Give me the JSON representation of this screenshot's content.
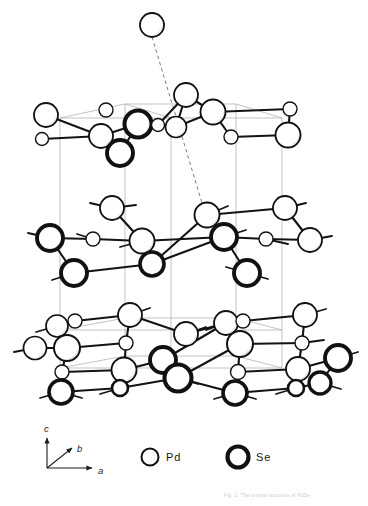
{
  "figure": {
    "title_visible": false,
    "background": "#ffffff",
    "width": 368,
    "height": 506
  },
  "colors": {
    "atom_outline": "#111111",
    "atom_fill": "#ffffff",
    "atom_shadow": "#9a9a9a",
    "bond": "#131313",
    "cell_edge": "#b4b4b4",
    "dashed_line": "#7d7d7d",
    "text": "#141414",
    "caption": "#c9c9c9"
  },
  "axes": {
    "name": "axis-triad",
    "origin": [
      47,
      468
    ],
    "labels": [
      {
        "text": "c",
        "x": 44,
        "y": 432
      },
      {
        "text": "b",
        "x": 77,
        "y": 452
      },
      {
        "text": "a",
        "x": 98,
        "y": 474
      }
    ],
    "arrows": [
      {
        "name": "c-axis-arrow",
        "x1": 47,
        "y1": 468,
        "x2": 47,
        "y2": 438
      },
      {
        "name": "b-axis-arrow",
        "x1": 47,
        "y1": 468,
        "x2": 72,
        "y2": 448
      },
      {
        "name": "a-axis-arrow",
        "x1": 47,
        "y1": 468,
        "x2": 92,
        "y2": 468
      }
    ]
  },
  "legend": {
    "name": "atom-legend",
    "entries": [
      {
        "label": "Pd",
        "symbol": "thin-circle",
        "cx": 150,
        "cy": 457,
        "r": 8.5,
        "stroke_width": 2.0,
        "label_x": 166,
        "label_y": 461
      },
      {
        "label": "Se",
        "symbol": "thick-circle",
        "cx": 238,
        "cy": 457,
        "r": 10.5,
        "stroke_width": 4.2,
        "label_x": 256,
        "label_y": 461
      }
    ]
  },
  "caption": {
    "name": "faint-footer-caption",
    "text": "Fig. 1.  The crystal structure of PdSe",
    "x": 224,
    "y": 497
  },
  "chart_data": {
    "type": "scatter",
    "title": "",
    "xlabel": "",
    "ylabel": "",
    "species": [
      {
        "name": "Pd",
        "style": "thin-circle",
        "stroke_width": 1.7
      },
      {
        "name": "Se",
        "style": "thick-circle",
        "stroke_width": 3.4
      }
    ],
    "cell_edges": [
      [
        60,
        118,
        125,
        104
      ],
      [
        125,
        104,
        236,
        104
      ],
      [
        236,
        104,
        282,
        118
      ],
      [
        282,
        118,
        171,
        118
      ],
      [
        171,
        118,
        60,
        118
      ],
      [
        125,
        104,
        171,
        118
      ],
      [
        60,
        118,
        60,
        368
      ],
      [
        125,
        104,
        125,
        356
      ],
      [
        236,
        104,
        236,
        356
      ],
      [
        282,
        118,
        282,
        368
      ],
      [
        171,
        118,
        171,
        368
      ],
      [
        60,
        368,
        125,
        356
      ],
      [
        125,
        356,
        236,
        356
      ],
      [
        236,
        356,
        282,
        368
      ],
      [
        282,
        368,
        171,
        368
      ],
      [
        171,
        368,
        60,
        368
      ],
      [
        60,
        330,
        125,
        318
      ],
      [
        125,
        318,
        236,
        318
      ],
      [
        236,
        318,
        282,
        330
      ],
      [
        282,
        330,
        171,
        330
      ],
      [
        171,
        330,
        60,
        330
      ]
    ],
    "dashed_lines": [
      [
        152,
        37,
        205,
        213
      ]
    ],
    "layers": [
      {
        "name": "isolated-top-atom",
        "atoms": [
          {
            "el": "Pd",
            "x": 152,
            "y": 25,
            "r": 12
          }
        ],
        "bonds": []
      },
      {
        "name": "upper-layer",
        "atoms": [
          {
            "el": "Pd",
            "x": 46,
            "y": 115,
            "r": 12
          },
          {
            "el": "Pd",
            "x": 42,
            "y": 139,
            "r": 6.5
          },
          {
            "el": "Pd",
            "x": 106,
            "y": 110,
            "r": 7
          },
          {
            "el": "Pd",
            "x": 101,
            "y": 136,
            "r": 12
          },
          {
            "el": "Se",
            "x": 120,
            "y": 153,
            "r": 13
          },
          {
            "el": "Se",
            "x": 138,
            "y": 124,
            "r": 13.5
          },
          {
            "el": "Pd",
            "x": 158,
            "y": 125,
            "r": 6.5
          },
          {
            "el": "Pd",
            "x": 176,
            "y": 127,
            "r": 10.5
          },
          {
            "el": "Pd",
            "x": 186,
            "y": 95,
            "r": 12
          },
          {
            "el": "Pd",
            "x": 213,
            "y": 112,
            "r": 12.5
          },
          {
            "el": "Pd",
            "x": 231,
            "y": 137,
            "r": 7
          },
          {
            "el": "Pd",
            "x": 290,
            "y": 109,
            "r": 7
          },
          {
            "el": "Pd",
            "x": 288,
            "y": 135,
            "r": 12.5
          }
        ],
        "bonds": [
          [
            46,
            115,
            101,
            136
          ],
          [
            101,
            136,
            138,
            124
          ],
          [
            138,
            124,
            158,
            125
          ],
          [
            158,
            125,
            176,
            127
          ],
          [
            176,
            127,
            213,
            112
          ],
          [
            186,
            95,
            213,
            112
          ],
          [
            213,
            112,
            231,
            137
          ],
          [
            231,
            137,
            288,
            135
          ],
          [
            120,
            153,
            138,
            124
          ],
          [
            101,
            136,
            120,
            153
          ],
          [
            42,
            139,
            101,
            136
          ],
          [
            186,
            95,
            176,
            127
          ],
          [
            186,
            95,
            158,
            125
          ],
          [
            290,
            109,
            288,
            135
          ],
          [
            213,
            112,
            290,
            109
          ]
        ]
      },
      {
        "name": "middle-layer",
        "atoms": [
          {
            "el": "Se",
            "x": 50,
            "y": 238,
            "r": 13
          },
          {
            "el": "Se",
            "x": 74,
            "y": 273,
            "r": 13
          },
          {
            "el": "Pd",
            "x": 93,
            "y": 239,
            "r": 7
          },
          {
            "el": "Pd",
            "x": 112,
            "y": 208,
            "r": 12
          },
          {
            "el": "Pd",
            "x": 142,
            "y": 241,
            "r": 12.5
          },
          {
            "el": "Pd",
            "x": 151,
            "y": 259,
            "r": 8
          },
          {
            "el": "Se",
            "x": 152,
            "y": 264,
            "r": 12
          },
          {
            "el": "Pd",
            "x": 207,
            "y": 215,
            "r": 12.5
          },
          {
            "el": "Se",
            "x": 224,
            "y": 237,
            "r": 13
          },
          {
            "el": "Pd",
            "x": 266,
            "y": 239,
            "r": 7
          },
          {
            "el": "Se",
            "x": 247,
            "y": 273,
            "r": 13
          },
          {
            "el": "Pd",
            "x": 285,
            "y": 208,
            "r": 12
          },
          {
            "el": "Pd",
            "x": 310,
            "y": 240,
            "r": 12
          }
        ],
        "bonds": [
          [
            50,
            238,
            93,
            239
          ],
          [
            93,
            239,
            142,
            241
          ],
          [
            50,
            238,
            74,
            273
          ],
          [
            112,
            208,
            142,
            241
          ],
          [
            142,
            241,
            152,
            264
          ],
          [
            152,
            264,
            207,
            215
          ],
          [
            207,
            215,
            224,
            237
          ],
          [
            224,
            237,
            266,
            239
          ],
          [
            266,
            239,
            310,
            240
          ],
          [
            224,
            237,
            247,
            273
          ],
          [
            285,
            208,
            310,
            240
          ],
          [
            74,
            273,
            152,
            264
          ],
          [
            142,
            241,
            224,
            237
          ],
          [
            152,
            264,
            224,
            237
          ],
          [
            207,
            215,
            285,
            208
          ]
        ],
        "stubs": [
          [
            50,
            238,
            28,
            233
          ],
          [
            74,
            273,
            52,
            280
          ],
          [
            112,
            208,
            90,
            203
          ],
          [
            112,
            208,
            136,
            205
          ],
          [
            93,
            239,
            77,
            234
          ],
          [
            207,
            215,
            228,
            206
          ],
          [
            266,
            239,
            288,
            244
          ],
          [
            247,
            273,
            226,
            267
          ],
          [
            247,
            273,
            268,
            279
          ],
          [
            285,
            208,
            306,
            203
          ],
          [
            310,
            240,
            332,
            236
          ],
          [
            224,
            237,
            246,
            230
          ],
          [
            142,
            241,
            120,
            247
          ]
        ]
      },
      {
        "name": "lower-layer",
        "atoms": [
          {
            "el": "Pd",
            "x": 57,
            "y": 326,
            "r": 11
          },
          {
            "el": "Pd",
            "x": 75,
            "y": 321,
            "r": 7
          },
          {
            "el": "Pd",
            "x": 35,
            "y": 348,
            "r": 11.5
          },
          {
            "el": "Pd",
            "x": 67,
            "y": 348,
            "r": 13
          },
          {
            "el": "Pd",
            "x": 62,
            "y": 372,
            "r": 7
          },
          {
            "el": "Se",
            "x": 61,
            "y": 392,
            "r": 12
          },
          {
            "el": "Pd",
            "x": 130,
            "y": 315,
            "r": 12
          },
          {
            "el": "Pd",
            "x": 126,
            "y": 343,
            "r": 7
          },
          {
            "el": "Pd",
            "x": 124,
            "y": 370,
            "r": 12.5
          },
          {
            "el": "Se",
            "x": 120,
            "y": 388,
            "r": 8
          },
          {
            "el": "Pd",
            "x": 186,
            "y": 334,
            "r": 12
          },
          {
            "el": "Se",
            "x": 163,
            "y": 360,
            "r": 13
          },
          {
            "el": "Se",
            "x": 178,
            "y": 378,
            "r": 13.5
          },
          {
            "el": "Pd",
            "x": 226,
            "y": 323,
            "r": 12
          },
          {
            "el": "Pd",
            "x": 243,
            "y": 321,
            "r": 7
          },
          {
            "el": "Pd",
            "x": 240,
            "y": 344,
            "r": 13
          },
          {
            "el": "Pd",
            "x": 238,
            "y": 372,
            "r": 7.5
          },
          {
            "el": "Se",
            "x": 235,
            "y": 393,
            "r": 12
          },
          {
            "el": "Pd",
            "x": 305,
            "y": 315,
            "r": 12
          },
          {
            "el": "Pd",
            "x": 302,
            "y": 343,
            "r": 7
          },
          {
            "el": "Pd",
            "x": 298,
            "y": 369,
            "r": 12
          },
          {
            "el": "Se",
            "x": 296,
            "y": 388,
            "r": 8
          },
          {
            "el": "Se",
            "x": 338,
            "y": 358,
            "r": 13
          },
          {
            "el": "Se",
            "x": 320,
            "y": 383,
            "r": 11
          }
        ],
        "bonds": [
          [
            57,
            326,
            75,
            321
          ],
          [
            57,
            326,
            67,
            348
          ],
          [
            35,
            348,
            67,
            348
          ],
          [
            67,
            348,
            62,
            372
          ],
          [
            62,
            372,
            61,
            392
          ],
          [
            75,
            321,
            130,
            315
          ],
          [
            130,
            315,
            126,
            343
          ],
          [
            126,
            343,
            124,
            370
          ],
          [
            124,
            370,
            120,
            388
          ],
          [
            67,
            348,
            126,
            343
          ],
          [
            62,
            372,
            124,
            370
          ],
          [
            61,
            392,
            120,
            388
          ],
          [
            130,
            315,
            186,
            334
          ],
          [
            186,
            334,
            226,
            323
          ],
          [
            163,
            360,
            178,
            378
          ],
          [
            124,
            370,
            163,
            360
          ],
          [
            178,
            378,
            235,
            393
          ],
          [
            226,
            323,
            243,
            321
          ],
          [
            226,
            323,
            240,
            344
          ],
          [
            240,
            344,
            238,
            372
          ],
          [
            238,
            372,
            235,
            393
          ],
          [
            243,
            321,
            305,
            315
          ],
          [
            305,
            315,
            302,
            343
          ],
          [
            302,
            343,
            298,
            369
          ],
          [
            298,
            369,
            296,
            388
          ],
          [
            240,
            344,
            302,
            343
          ],
          [
            238,
            372,
            298,
            369
          ],
          [
            235,
            393,
            296,
            388
          ],
          [
            338,
            358,
            320,
            383
          ],
          [
            298,
            369,
            338,
            358
          ],
          [
            296,
            388,
            320,
            383
          ],
          [
            178,
            378,
            240,
            344
          ],
          [
            163,
            360,
            226,
            323
          ],
          [
            120,
            388,
            178,
            378
          ]
        ],
        "stubs": [
          [
            57,
            326,
            36,
            332
          ],
          [
            35,
            348,
            14,
            352
          ],
          [
            61,
            392,
            40,
            398
          ],
          [
            61,
            392,
            82,
            398
          ],
          [
            130,
            315,
            150,
            308
          ],
          [
            120,
            388,
            100,
            394
          ],
          [
            178,
            378,
            198,
            384
          ],
          [
            186,
            334,
            206,
            327
          ],
          [
            226,
            323,
            206,
            330
          ],
          [
            235,
            393,
            214,
            399
          ],
          [
            235,
            393,
            256,
            399
          ],
          [
            305,
            315,
            326,
            309
          ],
          [
            338,
            358,
            358,
            352
          ],
          [
            320,
            383,
            341,
            389
          ],
          [
            302,
            343,
            324,
            340
          ],
          [
            296,
            388,
            276,
            394
          ]
        ]
      }
    ]
  }
}
